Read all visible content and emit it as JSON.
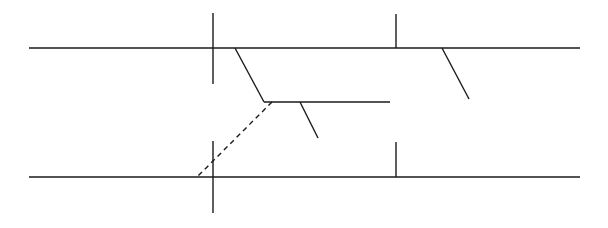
{
  "diagram": {
    "type": "line-diagram",
    "stroke_color": "#1a1a1a",
    "background": "#ffffff",
    "lines": [
      {
        "name": "top-horizontal-line",
        "x1": 29,
        "y1": 48,
        "x2": 580,
        "y2": 48,
        "style": "solid"
      },
      {
        "name": "top-left-vertical-tick",
        "x1": 213,
        "y1": 13,
        "x2": 213,
        "y2": 84,
        "style": "solid"
      },
      {
        "name": "top-right-vertical-tick",
        "x1": 396,
        "y1": 14,
        "x2": 396,
        "y2": 48,
        "style": "solid"
      },
      {
        "name": "top-branch-slant",
        "x1": 235,
        "y1": 48,
        "x2": 264,
        "y2": 102,
        "style": "solid"
      },
      {
        "name": "middle-horizontal-line",
        "x1": 264,
        "y1": 102,
        "x2": 390,
        "y2": 102,
        "style": "solid"
      },
      {
        "name": "middle-branch-slant",
        "x1": 300,
        "y1": 102,
        "x2": 318,
        "y2": 138,
        "style": "solid"
      },
      {
        "name": "right-branch-slant",
        "x1": 442,
        "y1": 48,
        "x2": 469,
        "y2": 99,
        "style": "solid"
      },
      {
        "name": "dashed-connector",
        "x1": 272,
        "y1": 102,
        "x2": 196,
        "y2": 178,
        "style": "dashed"
      },
      {
        "name": "bottom-horizontal-line",
        "x1": 29,
        "y1": 177,
        "x2": 580,
        "y2": 177,
        "style": "solid"
      },
      {
        "name": "bottom-left-vertical-tick",
        "x1": 213,
        "y1": 141,
        "x2": 213,
        "y2": 213,
        "style": "solid"
      },
      {
        "name": "bottom-right-vertical-tick",
        "x1": 396,
        "y1": 142,
        "x2": 396,
        "y2": 177,
        "style": "solid"
      }
    ]
  }
}
